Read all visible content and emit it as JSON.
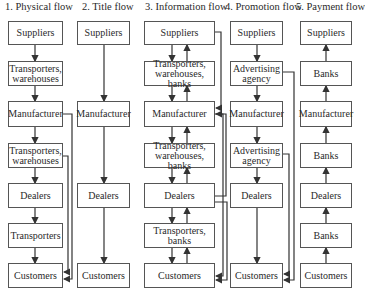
{
  "diagram": {
    "columns": [
      {
        "title": "1. Physical flow",
        "boxes": [
          "Suppliers",
          "Transporters, warehouses",
          "Manufacturer",
          "Transporters, warehouses",
          "Dealers",
          "Transporters",
          "Customers"
        ],
        "arrow_direction": "down",
        "side_link": {
          "from": "Manufacturer",
          "to": "Customers"
        }
      },
      {
        "title": "2. Title flow",
        "boxes": [
          "Suppliers",
          "Manufacturer",
          "Dealers",
          "Customers"
        ],
        "arrow_direction": "down"
      },
      {
        "title": "3. Information flow",
        "boxes": [
          "Suppliers",
          "Transporters, warehouses, banks",
          "Manufacturer",
          "Transporters, warehouses, banks",
          "Dealers",
          "Transporters, banks",
          "Customers"
        ],
        "arrow_direction": "both",
        "side_links": [
          {
            "from": "Suppliers",
            "to": "Manufacturer"
          },
          {
            "from": "Manufacturer",
            "to": "Customers"
          },
          {
            "from": "Dealers",
            "to": "Customers"
          }
        ]
      },
      {
        "title": "4. Promotion flow",
        "boxes": [
          "Suppliers",
          "Advertising agency",
          "Manufacturer",
          "Advertising agency",
          "Dealers",
          "Customers"
        ],
        "arrow_direction": "down",
        "side_link": {
          "from": "Advertising agency",
          "to": "Customers"
        }
      },
      {
        "title": "5. Payment flow",
        "boxes": [
          "Suppliers",
          "Banks",
          "Manufacturer",
          "Banks",
          "Dealers",
          "Banks",
          "Customers"
        ],
        "arrow_direction": "up"
      }
    ]
  }
}
